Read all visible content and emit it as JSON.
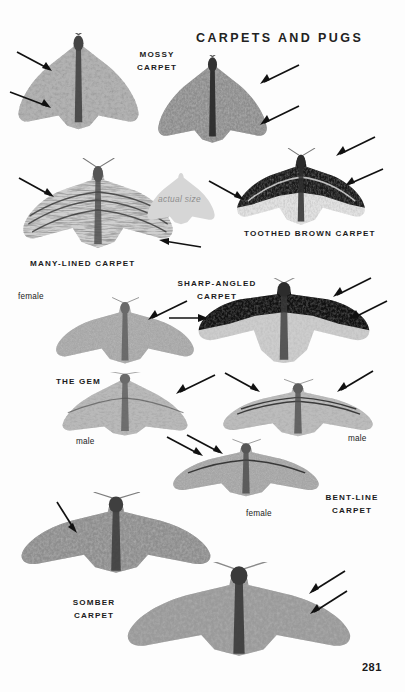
{
  "page": {
    "title": "CARPETS AND PUGS",
    "number": "281",
    "background_color": "#fdfdfd",
    "ink_color": "#1b1b1b"
  },
  "actual_size_marker": {
    "label": "actual size",
    "silhouette_color": "#d4d4d4",
    "text_color": "#8e8e8e"
  },
  "species": [
    {
      "id": "mossy-carpet",
      "label": "MOSSY\nCARPET",
      "plates": [
        {
          "id": "mossy-carpet-plate-1",
          "tone": "mid-grey-mottled"
        },
        {
          "id": "mossy-carpet-plate-2",
          "tone": "dark-grey-mottled"
        }
      ],
      "sex_labels": []
    },
    {
      "id": "many-lined-carpet",
      "label": "MANY-LINED CARPET",
      "plates": [
        {
          "id": "many-lined-carpet-plate-1",
          "tone": "banded-light-grey"
        }
      ],
      "sex_labels": []
    },
    {
      "id": "toothed-brown-carpet",
      "label": "TOOTHED BROWN CARPET",
      "plates": [
        {
          "id": "toothed-brown-carpet-plate-1",
          "tone": "black-and-pale-banded"
        }
      ],
      "sex_labels": []
    },
    {
      "id": "the-gem",
      "label": "THE GEM",
      "plates": [
        {
          "id": "the-gem-plate-female",
          "tone": "uniform-grey"
        },
        {
          "id": "the-gem-plate-male",
          "tone": "mid-grey-banded"
        }
      ],
      "sex_labels": [
        "female",
        "male"
      ]
    },
    {
      "id": "sharp-angled-carpet",
      "label": "SHARP-ANGLED\nCARPET",
      "plates": [
        {
          "id": "sharp-angled-carpet-plate-1",
          "tone": "black-band-pale-ground"
        }
      ],
      "sex_labels": []
    },
    {
      "id": "bent-line-carpet",
      "label": "BENT-LINE\nCARPET",
      "plates": [
        {
          "id": "bent-line-carpet-plate-male",
          "tone": "pale-grey-thin-lines"
        },
        {
          "id": "bent-line-carpet-plate-female",
          "tone": "mid-grey-thin-lines"
        }
      ],
      "sex_labels": [
        "male",
        "female"
      ]
    },
    {
      "id": "somber-carpet",
      "label": "SOMBER\nCARPET",
      "plates": [
        {
          "id": "somber-carpet-plate-1",
          "tone": "dark-grey-coarse"
        },
        {
          "id": "somber-carpet-plate-2",
          "tone": "dark-grey-coarse"
        }
      ],
      "sex_labels": []
    }
  ],
  "pointer_count": 18
}
